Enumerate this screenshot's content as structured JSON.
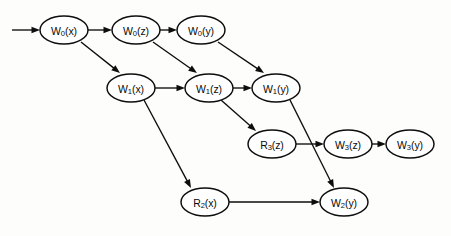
{
  "diagram": {
    "title": "",
    "type": "directed-acyclic-graph",
    "background_color": "#fdfdfc",
    "stroke_color": "#0d0d0d",
    "node_fill": "#ffffff",
    "nodes": [
      {
        "id": "w0x",
        "base": "W",
        "sub": "0",
        "arg": "(x)",
        "label": "W0(x)",
        "cx": 64,
        "cy": 30,
        "rx": 24,
        "ry": 14
      },
      {
        "id": "w0z",
        "base": "W",
        "sub": "0",
        "arg": "(z)",
        "label": "W0(z)",
        "cx": 136,
        "cy": 30,
        "rx": 24,
        "ry": 14
      },
      {
        "id": "w0y",
        "base": "W",
        "sub": "0",
        "arg": "(y)",
        "label": "W0(y)",
        "cx": 201,
        "cy": 30,
        "rx": 24,
        "ry": 14
      },
      {
        "id": "w1x",
        "base": "W",
        "sub": "1",
        "arg": "(x)",
        "label": "W1(x)",
        "cx": 131,
        "cy": 88,
        "rx": 24,
        "ry": 14
      },
      {
        "id": "w1z",
        "base": "W",
        "sub": "1",
        "arg": "(z)",
        "label": "W1(z)",
        "cx": 209,
        "cy": 88,
        "rx": 24,
        "ry": 14
      },
      {
        "id": "w1y",
        "base": "W",
        "sub": "1",
        "arg": "(y)",
        "label": "W1(y)",
        "cx": 276,
        "cy": 88,
        "rx": 24,
        "ry": 14
      },
      {
        "id": "r3z",
        "base": "R",
        "sub": "3",
        "arg": "(z)",
        "label": "R3(z)",
        "cx": 272,
        "cy": 144,
        "rx": 24,
        "ry": 14
      },
      {
        "id": "w3z",
        "base": "W",
        "sub": "3",
        "arg": "(z)",
        "label": "W3(z)",
        "cx": 348,
        "cy": 144,
        "rx": 24,
        "ry": 14
      },
      {
        "id": "w3y",
        "base": "W",
        "sub": "3",
        "arg": "(y)",
        "label": "W3(y)",
        "cx": 410,
        "cy": 144,
        "rx": 24,
        "ry": 14
      },
      {
        "id": "r2x",
        "base": "R",
        "sub": "2",
        "arg": "(x)",
        "label": "R2(x)",
        "cx": 205,
        "cy": 202,
        "rx": 24,
        "ry": 14
      },
      {
        "id": "w2y",
        "base": "W",
        "sub": "2",
        "arg": "(y)",
        "label": "W2(y)",
        "cx": 344,
        "cy": 202,
        "rx": 24,
        "ry": 14
      }
    ],
    "edges": [
      {
        "id": "entry-w0x",
        "from": "",
        "to": "w0x",
        "x1": 12,
        "y1": 30,
        "x2": 40,
        "y2": 30
      },
      {
        "id": "w0x-w0z",
        "from": "w0x",
        "to": "w0z",
        "x1": 88,
        "y1": 30,
        "x2": 112,
        "y2": 30
      },
      {
        "id": "w0z-w0y",
        "from": "w0z",
        "to": "w0y",
        "x1": 160,
        "y1": 30,
        "x2": 177,
        "y2": 30
      },
      {
        "id": "w0x-w1x",
        "from": "w0x",
        "to": "w1x",
        "x1": 81,
        "y1": 42,
        "x2": 120,
        "y2": 73
      },
      {
        "id": "w0z-w1z",
        "from": "w0z",
        "to": "w1z",
        "x1": 153,
        "y1": 42,
        "x2": 197,
        "y2": 73
      },
      {
        "id": "w0y-w1y",
        "from": "w0y",
        "to": "w1y",
        "x1": 218,
        "y1": 42,
        "x2": 264,
        "y2": 73
      },
      {
        "id": "w1x-w1z",
        "from": "w1x",
        "to": "w1z",
        "x1": 155,
        "y1": 88,
        "x2": 185,
        "y2": 88
      },
      {
        "id": "w1z-w1y",
        "from": "w1z",
        "to": "w1y",
        "x1": 233,
        "y1": 88,
        "x2": 252,
        "y2": 88
      },
      {
        "id": "w1x-r2x",
        "from": "w1x",
        "to": "r2x",
        "x1": 144,
        "y1": 100,
        "x2": 191,
        "y2": 188
      },
      {
        "id": "w1z-r3z",
        "from": "w1z",
        "to": "r3z",
        "x1": 221,
        "y1": 100,
        "x2": 256,
        "y2": 131
      },
      {
        "id": "w1y-w2y",
        "from": "w1y",
        "to": "w2y",
        "x1": 290,
        "y1": 100,
        "x2": 334,
        "y2": 188
      },
      {
        "id": "r3z-w3z",
        "from": "r3z",
        "to": "w3z",
        "x1": 296,
        "y1": 144,
        "x2": 324,
        "y2": 144
      },
      {
        "id": "w3z-w3y",
        "from": "w3z",
        "to": "w3y",
        "x1": 372,
        "y1": 144,
        "x2": 386,
        "y2": 144
      },
      {
        "id": "r2x-w2y",
        "from": "r2x",
        "to": "w2y",
        "x1": 229,
        "y1": 202,
        "x2": 320,
        "y2": 202
      }
    ]
  }
}
